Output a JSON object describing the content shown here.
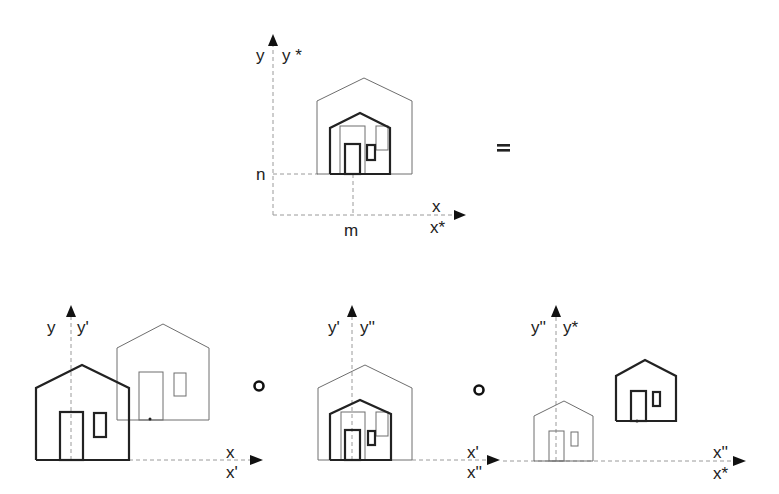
{
  "figure": {
    "operators": {
      "equals": "=",
      "compose": "o"
    },
    "top": {
      "labels": {
        "y": "y",
        "y_star": "y *",
        "x": "x",
        "x_star": "x*",
        "n": "n",
        "m": "m"
      }
    },
    "bottom_left": {
      "labels": {
        "y": "y",
        "y_prime": "y'",
        "x": "x",
        "x_prime": "x'"
      }
    },
    "bottom_middle": {
      "labels": {
        "y_prime": "y'",
        "y_dprime": "y''",
        "x_prime": "x'",
        "x_dprime": "x''"
      }
    },
    "bottom_right": {
      "labels": {
        "y_dprime": "y''",
        "y_star": "y*",
        "x_dprime": "x''",
        "x_star": "x*"
      }
    }
  }
}
